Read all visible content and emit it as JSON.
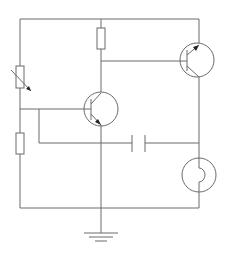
{
  "diagram": {
    "type": "circuit-schematic",
    "colors": {
      "line": "#6a6a6a",
      "arrow": "#222222",
      "background": "#ffffff"
    },
    "components": [
      {
        "id": "variable-resistor",
        "kind": "variable resistor",
        "position": "left branch, upper"
      },
      {
        "id": "resistor-left",
        "kind": "resistor",
        "position": "left branch, lower"
      },
      {
        "id": "resistor-top",
        "kind": "resistor",
        "position": "top center, collector of Q1"
      },
      {
        "id": "transistor-q1",
        "kind": "NPN transistor",
        "position": "center"
      },
      {
        "id": "transistor-q2",
        "kind": "PNP transistor",
        "position": "top right"
      },
      {
        "id": "capacitor",
        "kind": "capacitor",
        "position": "center lower"
      },
      {
        "id": "lamp",
        "kind": "lamp",
        "position": "right lower"
      },
      {
        "id": "ground",
        "kind": "ground",
        "position": "bottom center"
      }
    ]
  }
}
